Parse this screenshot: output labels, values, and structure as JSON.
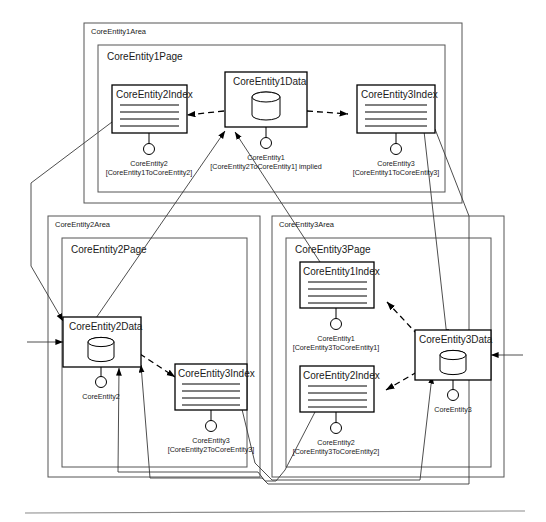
{
  "diagram": {
    "background": "#ffffff",
    "line_color": "#000000",
    "container_color": "#555555"
  },
  "areas": [
    {
      "id": "area1",
      "label": "CoreEntity1Area",
      "page_label": "CoreEntity1Page"
    },
    {
      "id": "area2",
      "label": "CoreEntity2Area",
      "page_label": "CoreEntity2Page"
    },
    {
      "id": "area3",
      "label": "CoreEntity3Area",
      "page_label": "CoreEntity3Page"
    }
  ],
  "nodes": [
    {
      "id": "n1",
      "kind": "index",
      "title": "CoreEntity2Index",
      "port": {
        "name": "CoreEntity2",
        "assoc": "[CoreEntity1ToCoreEntity2]"
      }
    },
    {
      "id": "n2",
      "kind": "data",
      "title": "CoreEntity1Data",
      "port": {
        "name": "CoreEntity1",
        "assoc": "[CoreEntity2ToCoreEntity1] implied"
      }
    },
    {
      "id": "n3",
      "kind": "index",
      "title": "CoreEntity3Index",
      "port": {
        "name": "CoreEntity3",
        "assoc": "[CoreEntity1ToCoreEntity3]"
      }
    },
    {
      "id": "n4",
      "kind": "data",
      "title": "CoreEntity2Data",
      "port": {
        "name": "CoreEntity2",
        "assoc": ""
      }
    },
    {
      "id": "n5",
      "kind": "index",
      "title": "CoreEntity3Index",
      "port": {
        "name": "CoreEntity3",
        "assoc": "[CoreEntity2ToCoreEntity3]"
      }
    },
    {
      "id": "n6",
      "kind": "index",
      "title": "CoreEntity1Index",
      "port": {
        "name": "CoreEntity1",
        "assoc": "[CoreEntity3ToCoreEntity1]"
      }
    },
    {
      "id": "n7",
      "kind": "index",
      "title": "CoreEntity2Index",
      "port": {
        "name": "CoreEntity2",
        "assoc": "[CoreEntity3ToCoreEntity2]"
      }
    },
    {
      "id": "n8",
      "kind": "data",
      "title": "CoreEntity3Data",
      "port": {
        "name": "CoreEntity3",
        "assoc": ""
      }
    }
  ]
}
